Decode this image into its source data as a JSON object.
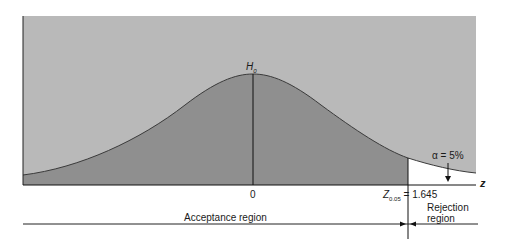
{
  "diagram": {
    "type": "normal-distribution-hypothesis-test",
    "null_hypothesis_label": "H",
    "null_hypothesis_sub": "0",
    "center_tick_label": "0",
    "axis_label": "z",
    "critical_value_label": "Z",
    "critical_value_sub": "0.05",
    "critical_value_eq": "= 1.645",
    "alpha_label": "α = 5%",
    "acceptance_region_label": "Acceptance region",
    "rejection_region_label_line1": "Rejection",
    "rejection_region_label_line2": "region",
    "colors": {
      "panel_background": "#b9b9b9",
      "curve_fill": "#8f8f8f",
      "rejection_fill": "#ffffff",
      "lines": "#222222"
    }
  }
}
